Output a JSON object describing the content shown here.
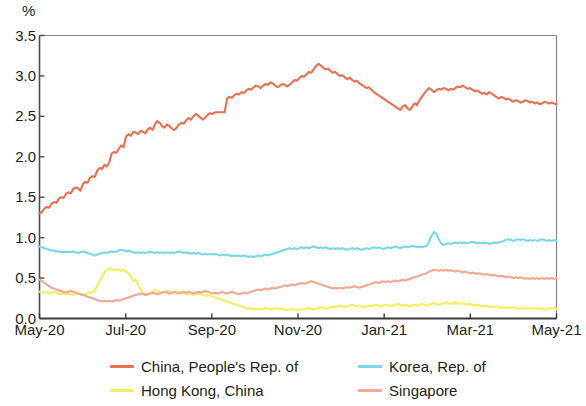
{
  "chart_data": {
    "type": "line",
    "title": "",
    "subtitle": "",
    "xlabel": "",
    "ylabel": "%",
    "unit_label": "%",
    "ylim": [
      0.0,
      3.5
    ],
    "ytick_labels": [
      "3.5",
      "3.0",
      "2.5",
      "2.0",
      "1.5",
      "1.0",
      "0.5",
      "0.0"
    ],
    "ytick_values": [
      3.5,
      3.0,
      2.5,
      2.0,
      1.5,
      1.0,
      0.5,
      0.0
    ],
    "xtick_labels": [
      "May-20",
      "Jul-20",
      "Sep-20",
      "Nov-20",
      "Jan-21",
      "Mar-21",
      "May-21"
    ],
    "xlim": [
      0,
      12
    ],
    "grid": false,
    "legend_position": "bottom",
    "colors": {
      "china": "#ee6f4e",
      "hong_kong": "#f4ef5a",
      "korea": "#79d7ec",
      "singapore": "#f3a88f",
      "axis": "#4d4d4d",
      "text": "#231f20"
    },
    "series": [
      {
        "name": "China, People's Rep. of",
        "color": "#ee6f4e",
        "values": [
          1.3,
          1.32,
          1.36,
          1.38,
          1.37,
          1.42,
          1.44,
          1.43,
          1.48,
          1.5,
          1.49,
          1.54,
          1.56,
          1.55,
          1.6,
          1.62,
          1.61,
          1.58,
          1.66,
          1.69,
          1.68,
          1.74,
          1.76,
          1.75,
          1.83,
          1.86,
          1.85,
          1.9,
          1.88,
          1.93,
          2.04,
          2.06,
          2.05,
          2.1,
          2.14,
          2.12,
          2.25,
          2.28,
          2.26,
          2.31,
          2.3,
          2.28,
          2.32,
          2.31,
          2.29,
          2.34,
          2.36,
          2.33,
          2.4,
          2.44,
          2.42,
          2.38,
          2.36,
          2.4,
          2.38,
          2.35,
          2.33,
          2.36,
          2.4,
          2.42,
          2.41,
          2.45,
          2.48,
          2.46,
          2.5,
          2.53,
          2.51,
          2.48,
          2.46,
          2.49,
          2.52,
          2.54,
          2.53,
          2.55,
          2.55,
          2.55,
          2.55,
          2.55,
          2.72,
          2.74,
          2.73,
          2.76,
          2.78,
          2.77,
          2.8,
          2.79,
          2.82,
          2.84,
          2.83,
          2.86,
          2.88,
          2.87,
          2.85,
          2.88,
          2.9,
          2.89,
          2.92,
          2.91,
          2.88,
          2.86,
          2.88,
          2.9,
          2.89,
          2.87,
          2.89,
          2.92,
          2.95,
          2.94,
          2.97,
          3.0,
          2.99,
          3.02,
          3.05,
          3.04,
          3.08,
          3.12,
          3.15,
          3.13,
          3.1,
          3.08,
          3.09,
          3.06,
          3.04,
          3.05,
          3.02,
          3.0,
          3.01,
          2.98,
          2.96,
          2.98,
          2.95,
          2.93,
          2.94,
          2.91,
          2.89,
          2.87,
          2.85,
          2.86,
          2.83,
          2.8,
          2.78,
          2.76,
          2.74,
          2.72,
          2.7,
          2.68,
          2.66,
          2.64,
          2.62,
          2.6,
          2.58,
          2.62,
          2.64,
          2.6,
          2.58,
          2.62,
          2.66,
          2.64,
          2.7,
          2.74,
          2.78,
          2.82,
          2.85,
          2.83,
          2.8,
          2.82,
          2.84,
          2.83,
          2.85,
          2.84,
          2.82,
          2.84,
          2.83,
          2.85,
          2.87,
          2.86,
          2.88,
          2.86,
          2.84,
          2.85,
          2.83,
          2.81,
          2.82,
          2.8,
          2.78,
          2.79,
          2.77,
          2.8,
          2.78,
          2.76,
          2.74,
          2.72,
          2.74,
          2.73,
          2.71,
          2.72,
          2.7,
          2.68,
          2.7,
          2.69,
          2.67,
          2.68,
          2.7,
          2.69,
          2.67,
          2.68,
          2.66,
          2.67,
          2.65,
          2.66,
          2.68,
          2.67,
          2.66,
          2.67,
          2.66,
          2.65
        ]
      },
      {
        "name": "Hong Kong, China",
        "color": "#f4ef5a",
        "values": [
          0.33,
          0.32,
          0.33,
          0.32,
          0.31,
          0.32,
          0.33,
          0.32,
          0.31,
          0.3,
          0.31,
          0.3,
          0.31,
          0.3,
          0.29,
          0.3,
          0.31,
          0.3,
          0.29,
          0.3,
          0.31,
          0.32,
          0.33,
          0.35,
          0.4,
          0.46,
          0.52,
          0.57,
          0.6,
          0.62,
          0.61,
          0.6,
          0.61,
          0.6,
          0.59,
          0.6,
          0.58,
          0.56,
          0.52,
          0.46,
          0.48,
          0.42,
          0.36,
          0.32,
          0.3,
          0.29,
          0.31,
          0.33,
          0.35,
          0.34,
          0.33,
          0.32,
          0.33,
          0.34,
          0.33,
          0.32,
          0.31,
          0.32,
          0.33,
          0.32,
          0.31,
          0.3,
          0.31,
          0.3,
          0.29,
          0.3,
          0.31,
          0.3,
          0.29,
          0.28,
          0.29,
          0.28,
          0.27,
          0.26,
          0.25,
          0.24,
          0.23,
          0.22,
          0.21,
          0.2,
          0.19,
          0.18,
          0.17,
          0.16,
          0.15,
          0.14,
          0.13,
          0.12,
          0.13,
          0.12,
          0.11,
          0.12,
          0.11,
          0.12,
          0.13,
          0.12,
          0.11,
          0.12,
          0.13,
          0.12,
          0.11,
          0.12,
          0.11,
          0.1,
          0.11,
          0.12,
          0.11,
          0.1,
          0.11,
          0.12,
          0.11,
          0.12,
          0.13,
          0.12,
          0.11,
          0.12,
          0.13,
          0.14,
          0.13,
          0.12,
          0.13,
          0.14,
          0.15,
          0.14,
          0.15,
          0.16,
          0.15,
          0.14,
          0.15,
          0.16,
          0.17,
          0.16,
          0.15,
          0.16,
          0.15,
          0.14,
          0.15,
          0.16,
          0.15,
          0.16,
          0.17,
          0.16,
          0.15,
          0.16,
          0.17,
          0.16,
          0.15,
          0.16,
          0.17,
          0.18,
          0.17,
          0.16,
          0.17,
          0.16,
          0.15,
          0.16,
          0.17,
          0.16,
          0.17,
          0.18,
          0.17,
          0.16,
          0.17,
          0.18,
          0.19,
          0.18,
          0.17,
          0.18,
          0.19,
          0.2,
          0.19,
          0.18,
          0.19,
          0.2,
          0.19,
          0.18,
          0.19,
          0.18,
          0.17,
          0.18,
          0.17,
          0.16,
          0.17,
          0.16,
          0.15,
          0.16,
          0.15,
          0.14,
          0.15,
          0.14,
          0.15,
          0.14,
          0.13,
          0.14,
          0.13,
          0.14,
          0.13,
          0.14,
          0.13,
          0.12,
          0.13,
          0.12,
          0.13,
          0.12,
          0.13,
          0.12,
          0.13,
          0.12,
          0.13,
          0.12,
          0.11,
          0.12,
          0.13,
          0.12,
          0.13,
          0.12
        ]
      },
      {
        "name": "Korea, Rep. of",
        "color": "#79d7ec",
        "values": [
          0.89,
          0.88,
          0.87,
          0.86,
          0.85,
          0.84,
          0.84,
          0.83,
          0.83,
          0.82,
          0.83,
          0.82,
          0.83,
          0.82,
          0.83,
          0.82,
          0.81,
          0.82,
          0.83,
          0.82,
          0.81,
          0.8,
          0.79,
          0.78,
          0.79,
          0.8,
          0.81,
          0.82,
          0.81,
          0.82,
          0.83,
          0.82,
          0.83,
          0.84,
          0.85,
          0.84,
          0.83,
          0.84,
          0.83,
          0.82,
          0.81,
          0.82,
          0.81,
          0.82,
          0.81,
          0.82,
          0.83,
          0.82,
          0.81,
          0.82,
          0.81,
          0.82,
          0.81,
          0.82,
          0.81,
          0.82,
          0.81,
          0.82,
          0.83,
          0.82,
          0.81,
          0.82,
          0.81,
          0.8,
          0.81,
          0.8,
          0.81,
          0.8,
          0.79,
          0.8,
          0.79,
          0.8,
          0.79,
          0.8,
          0.79,
          0.78,
          0.79,
          0.78,
          0.79,
          0.78,
          0.77,
          0.78,
          0.77,
          0.78,
          0.77,
          0.78,
          0.77,
          0.76,
          0.77,
          0.76,
          0.77,
          0.78,
          0.77,
          0.78,
          0.79,
          0.78,
          0.79,
          0.8,
          0.81,
          0.82,
          0.83,
          0.84,
          0.85,
          0.86,
          0.87,
          0.86,
          0.87,
          0.86,
          0.87,
          0.88,
          0.87,
          0.88,
          0.87,
          0.88,
          0.89,
          0.88,
          0.87,
          0.88,
          0.87,
          0.88,
          0.87,
          0.86,
          0.87,
          0.86,
          0.87,
          0.86,
          0.87,
          0.86,
          0.85,
          0.86,
          0.87,
          0.86,
          0.87,
          0.86,
          0.85,
          0.86,
          0.87,
          0.86,
          0.87,
          0.88,
          0.87,
          0.88,
          0.87,
          0.86,
          0.87,
          0.88,
          0.87,
          0.88,
          0.89,
          0.88,
          0.87,
          0.88,
          0.89,
          0.88,
          0.89,
          0.9,
          0.89,
          0.88,
          0.89,
          0.88,
          0.89,
          0.9,
          0.95,
          1.02,
          1.07,
          1.05,
          0.98,
          0.93,
          0.91,
          0.92,
          0.93,
          0.92,
          0.93,
          0.94,
          0.93,
          0.94,
          0.93,
          0.94,
          0.93,
          0.94,
          0.95,
          0.94,
          0.93,
          0.94,
          0.93,
          0.94,
          0.93,
          0.92,
          0.93,
          0.94,
          0.93,
          0.94,
          0.95,
          0.96,
          0.97,
          0.98,
          0.97,
          0.96,
          0.97,
          0.98,
          0.97,
          0.98,
          0.97,
          0.96,
          0.97,
          0.96,
          0.97,
          0.96,
          0.97,
          0.98,
          0.97,
          0.96,
          0.97,
          0.96,
          0.97,
          0.96
        ]
      },
      {
        "name": "Singapore",
        "color": "#f3a88f",
        "values": [
          0.48,
          0.46,
          0.44,
          0.42,
          0.4,
          0.38,
          0.37,
          0.36,
          0.35,
          0.34,
          0.33,
          0.32,
          0.33,
          0.34,
          0.33,
          0.32,
          0.31,
          0.3,
          0.29,
          0.28,
          0.27,
          0.26,
          0.25,
          0.24,
          0.23,
          0.22,
          0.21,
          0.22,
          0.21,
          0.22,
          0.21,
          0.22,
          0.23,
          0.22,
          0.23,
          0.24,
          0.25,
          0.26,
          0.27,
          0.28,
          0.29,
          0.3,
          0.31,
          0.3,
          0.29,
          0.3,
          0.31,
          0.32,
          0.31,
          0.3,
          0.31,
          0.32,
          0.33,
          0.32,
          0.31,
          0.32,
          0.33,
          0.32,
          0.31,
          0.32,
          0.33,
          0.32,
          0.33,
          0.32,
          0.31,
          0.32,
          0.33,
          0.32,
          0.33,
          0.34,
          0.33,
          0.32,
          0.31,
          0.32,
          0.31,
          0.32,
          0.33,
          0.32,
          0.31,
          0.32,
          0.33,
          0.32,
          0.31,
          0.3,
          0.31,
          0.32,
          0.31,
          0.32,
          0.33,
          0.34,
          0.35,
          0.36,
          0.35,
          0.36,
          0.37,
          0.36,
          0.37,
          0.38,
          0.37,
          0.38,
          0.39,
          0.4,
          0.41,
          0.4,
          0.41,
          0.42,
          0.41,
          0.42,
          0.43,
          0.44,
          0.43,
          0.44,
          0.45,
          0.46,
          0.45,
          0.44,
          0.43,
          0.42,
          0.41,
          0.4,
          0.39,
          0.38,
          0.37,
          0.38,
          0.37,
          0.38,
          0.37,
          0.38,
          0.39,
          0.38,
          0.39,
          0.4,
          0.39,
          0.38,
          0.39,
          0.4,
          0.41,
          0.42,
          0.43,
          0.44,
          0.45,
          0.44,
          0.45,
          0.46,
          0.45,
          0.46,
          0.45,
          0.46,
          0.47,
          0.46,
          0.47,
          0.48,
          0.47,
          0.48,
          0.49,
          0.5,
          0.51,
          0.52,
          0.53,
          0.54,
          0.55,
          0.56,
          0.58,
          0.59,
          0.6,
          0.6,
          0.59,
          0.6,
          0.59,
          0.6,
          0.59,
          0.6,
          0.59,
          0.58,
          0.59,
          0.58,
          0.57,
          0.58,
          0.57,
          0.56,
          0.57,
          0.56,
          0.55,
          0.56,
          0.55,
          0.54,
          0.55,
          0.54,
          0.53,
          0.54,
          0.53,
          0.52,
          0.53,
          0.52,
          0.51,
          0.52,
          0.51,
          0.5,
          0.51,
          0.5,
          0.51,
          0.5,
          0.49,
          0.5,
          0.49,
          0.5,
          0.49,
          0.5,
          0.49,
          0.5,
          0.49,
          0.5,
          0.49,
          0.5,
          0.49,
          0.5
        ]
      }
    ]
  },
  "legend": {
    "entries": [
      {
        "label": "China, People's Rep. of",
        "color": "#ee6f4e"
      },
      {
        "label": "Korea, Rep. of",
        "color": "#79d7ec"
      },
      {
        "label": "Hong Kong, China",
        "color": "#f4ef5a"
      },
      {
        "label": "Singapore",
        "color": "#f3a88f"
      }
    ]
  }
}
